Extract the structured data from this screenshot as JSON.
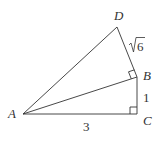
{
  "diagram": {
    "type": "geometry",
    "points": {
      "A": {
        "label": "A",
        "x": 23,
        "y": 114
      },
      "B": {
        "label": "B",
        "x": 137,
        "y": 77
      },
      "C": {
        "label": "C",
        "x": 137,
        "y": 114
      },
      "D": {
        "label": "D",
        "x": 117,
        "y": 27
      }
    },
    "segments": [
      "AD",
      "DB",
      "AB",
      "BC",
      "AC"
    ],
    "right_angles": [
      "C",
      "B (angle ABD)"
    ],
    "lengths": {
      "AC": "3",
      "BC": "1",
      "DB_radicand": "6"
    },
    "colors": {
      "stroke": "#333333",
      "background": "#ffffff"
    }
  }
}
